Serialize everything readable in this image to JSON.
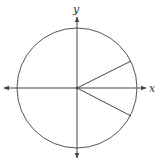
{
  "diagram": {
    "type": "unit-circle",
    "axes": {
      "x_label": "x",
      "y_label": "y"
    },
    "center": [
      77,
      88
    ],
    "radius": 60,
    "radii": [
      {
        "name": "upper-radius",
        "end": [
          131,
          61
        ]
      },
      {
        "name": "lower-radius",
        "end": [
          131,
          116
        ]
      }
    ],
    "colors": {
      "stroke": "#444444",
      "background": "#ffffff"
    }
  }
}
